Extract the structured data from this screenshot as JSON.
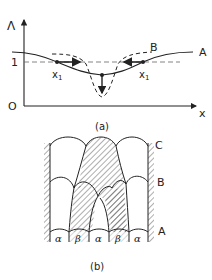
{
  "figure_a": {
    "y_axis_label": "Λ",
    "x_axis_label": "x",
    "origin_label": "O",
    "y_tick_label": "1",
    "curve_label_A": "A",
    "curve_label_B": "B",
    "point_label_left": "x",
    "point_label_left_sub": "1",
    "point_label_right": "x",
    "point_label_right_sub": "1",
    "caption": "(a)"
  },
  "figure_b": {
    "layer_labels": [
      "C",
      "B",
      "A"
    ],
    "phase_labels": [
      "α",
      "β",
      "α",
      "β",
      "α"
    ],
    "caption": "(b)"
  },
  "colors": {
    "ink": "#222222",
    "background": "#ffffff"
  }
}
